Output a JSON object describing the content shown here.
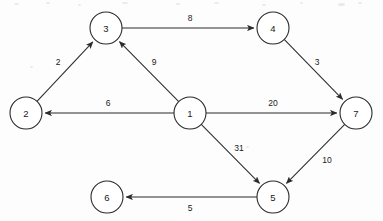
{
  "diagram": {
    "type": "directed-weighted-graph",
    "title": "",
    "node_radius": 16,
    "colors": {
      "background": "#fdfdfd",
      "stroke": "#2b2b2b",
      "node_fill": "#ffffff",
      "text": "#1a1a1a"
    },
    "nodes": [
      {
        "id": "1",
        "label": "1",
        "x": 190,
        "y": 113
      },
      {
        "id": "2",
        "label": "2",
        "x": 26,
        "y": 113
      },
      {
        "id": "3",
        "label": "3",
        "x": 106,
        "y": 28
      },
      {
        "id": "4",
        "label": "4",
        "x": 273,
        "y": 28
      },
      {
        "id": "5",
        "label": "5",
        "x": 273,
        "y": 197
      },
      {
        "id": "6",
        "label": "6",
        "x": 107,
        "y": 197
      },
      {
        "id": "7",
        "label": "7",
        "x": 356,
        "y": 113
      }
    ],
    "edges": [
      {
        "from": "2",
        "to": "3",
        "weight": "2",
        "label_x": 58,
        "label_y": 62,
        "directed": true
      },
      {
        "from": "3",
        "to": "4",
        "weight": "8",
        "label_x": 190,
        "label_y": 18,
        "directed": true
      },
      {
        "from": "1",
        "to": "3",
        "weight": "9",
        "label_x": 154,
        "label_y": 62,
        "directed": true
      },
      {
        "from": "4",
        "to": "7",
        "weight": "3",
        "label_x": 317,
        "label_y": 62,
        "directed": true
      },
      {
        "from": "1",
        "to": "2",
        "weight": "6",
        "label_x": 108,
        "label_y": 103,
        "directed": true
      },
      {
        "from": "1",
        "to": "7",
        "weight": "20",
        "label_x": 273,
        "label_y": 103,
        "directed": true
      },
      {
        "from": "1",
        "to": "5",
        "weight": "31",
        "label_x": 239,
        "label_y": 148,
        "directed": true
      },
      {
        "from": "7",
        "to": "5",
        "weight": "10",
        "label_x": 327,
        "label_y": 160,
        "directed": true
      },
      {
        "from": "5",
        "to": "6",
        "weight": "5",
        "label_x": 190,
        "label_y": 208,
        "directed": true
      }
    ],
    "specks": [
      {
        "x": 14,
        "y": 3,
        "w": 5,
        "h": 2
      },
      {
        "x": 46,
        "y": 2,
        "w": 4,
        "h": 2
      },
      {
        "x": 78,
        "y": 4,
        "w": 3,
        "h": 2
      },
      {
        "x": 122,
        "y": 2,
        "w": 6,
        "h": 2
      },
      {
        "x": 176,
        "y": 3,
        "w": 4,
        "h": 2
      },
      {
        "x": 214,
        "y": 2,
        "w": 5,
        "h": 2
      },
      {
        "x": 262,
        "y": 4,
        "w": 4,
        "h": 2
      },
      {
        "x": 300,
        "y": 2,
        "w": 3,
        "h": 2
      },
      {
        "x": 338,
        "y": 3,
        "w": 7,
        "h": 3
      },
      {
        "x": 358,
        "y": 2,
        "w": 4,
        "h": 2
      },
      {
        "x": 246,
        "y": 146,
        "w": 3,
        "h": 2
      },
      {
        "x": 30,
        "y": 66,
        "w": 3,
        "h": 2
      }
    ]
  }
}
